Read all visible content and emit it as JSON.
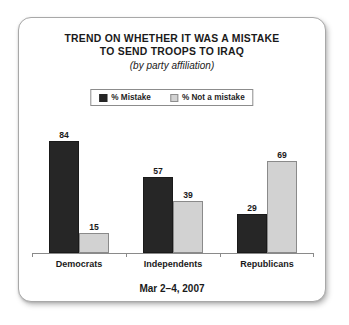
{
  "card": {
    "title_line_1": "TREND ON WHETHER IT WAS A MISTAKE",
    "title_line_2": "TO SEND TROOPS TO IRAQ",
    "subtitle": "(by party affiliation)",
    "footer_date": "Mar 2–4, 2007"
  },
  "legend": {
    "items": [
      {
        "label": "% Mistake",
        "swatch": "dark-swatch-icon",
        "color": "#262626"
      },
      {
        "label": "% Not a mistake",
        "swatch": "light-swatch-icon",
        "color": "#d2d2d2"
      }
    ]
  },
  "colors": {
    "mistake": "#262626",
    "not_a_mistake": "#d2d2d2",
    "axis": "#8a8a8a",
    "card_border": "#a8a8a8",
    "text": "#1a1a1a",
    "background": "#ffffff"
  },
  "chart_data": {
    "type": "bar",
    "title": "TREND ON WHETHER IT WAS A MISTAKE TO SEND TROOPS TO IRAQ",
    "subtitle": "(by party affiliation)",
    "xlabel": "",
    "ylabel": "",
    "ylim": [
      0,
      100
    ],
    "grid": false,
    "legend_position": "top-center",
    "categories": [
      "Democrats",
      "Independents",
      "Republicans"
    ],
    "series": [
      {
        "name": "% Mistake",
        "color": "#262626",
        "values": [
          84,
          57,
          29
        ]
      },
      {
        "name": "% Not a mistake",
        "color": "#d2d2d2",
        "values": [
          15,
          39,
          69
        ]
      }
    ],
    "annotations": [
      "Mar 2–4, 2007"
    ],
    "bars": [
      {
        "category": "Democrats",
        "series": "% Mistake",
        "value": 84,
        "label": "84"
      },
      {
        "category": "Democrats",
        "series": "% Not a mistake",
        "value": 15,
        "label": "15"
      },
      {
        "category": "Independents",
        "series": "% Mistake",
        "value": 57,
        "label": "57"
      },
      {
        "category": "Independents",
        "series": "% Not a mistake",
        "value": 39,
        "label": "39"
      },
      {
        "category": "Republicans",
        "series": "% Mistake",
        "value": 29,
        "label": "29"
      },
      {
        "category": "Republicans",
        "series": "% Not a mistake",
        "value": 69,
        "label": "69"
      }
    ]
  }
}
